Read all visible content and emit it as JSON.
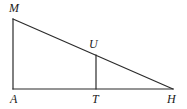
{
  "figure": {
    "kind": "geometry-diagram",
    "width": 187,
    "height": 109,
    "background_color": "#ffffff",
    "stroke_color": "#2b2b2b",
    "stroke_width": 1.2,
    "label_color": "#1a1a1a",
    "label_font_size": 12,
    "label_style": "italic-serif"
  },
  "points": {
    "M": {
      "label": "M",
      "x": 13,
      "y": 19,
      "label_x": 9,
      "label_y": 2
    },
    "A": {
      "label": "A",
      "x": 13,
      "y": 89,
      "label_x": 10,
      "label_y": 93
    },
    "T": {
      "label": "T",
      "x": 96,
      "y": 89,
      "label_x": 92,
      "label_y": 93
    },
    "H": {
      "label": "H",
      "x": 173,
      "y": 89,
      "label_x": 167,
      "label_y": 93
    },
    "U": {
      "label": "U",
      "x": 96,
      "y": 55,
      "label_x": 89,
      "label_y": 38
    }
  },
  "segments": [
    {
      "name": "MA",
      "from": "M",
      "to": "A",
      "x1": 13,
      "y1": 19,
      "x2": 13,
      "y2": 89
    },
    {
      "name": "AH",
      "from": "A",
      "to": "H",
      "x1": 13,
      "y1": 89,
      "x2": 173,
      "y2": 89
    },
    {
      "name": "MH",
      "from": "M",
      "to": "H",
      "x1": 13,
      "y1": 19,
      "x2": 173,
      "y2": 89
    },
    {
      "name": "UT",
      "from": "U",
      "to": "T",
      "x1": 96,
      "y1": 55,
      "x2": 96,
      "y2": 89
    }
  ]
}
